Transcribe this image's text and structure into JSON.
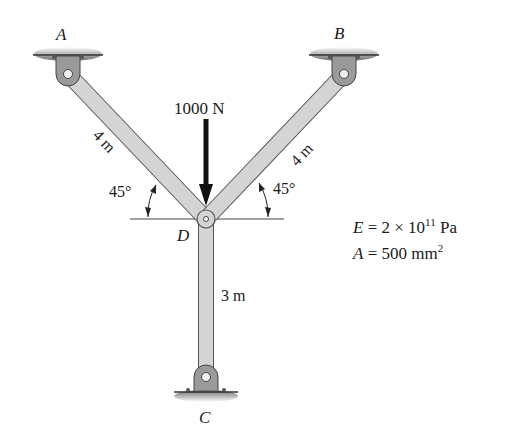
{
  "diagram": {
    "type": "truss-structure",
    "nodes": {
      "A": {
        "label": "A",
        "support": "pin",
        "x": 68,
        "y": 74
      },
      "B": {
        "label": "B",
        "support": "pin",
        "x": 344,
        "y": 74
      },
      "C": {
        "label": "C",
        "support": "pin",
        "x": 206,
        "y": 377
      },
      "D": {
        "label": "D",
        "joint": "pin",
        "x": 206,
        "y": 219
      }
    },
    "members": [
      {
        "id": "AD",
        "from": "A",
        "to": "D",
        "length_label": "4 m",
        "angle_label": "45°"
      },
      {
        "id": "BD",
        "from": "B",
        "to": "D",
        "length_label": "4 m",
        "angle_label": "45°"
      },
      {
        "id": "CD",
        "from": "C",
        "to": "D",
        "length_label": "3 m"
      }
    ],
    "load": {
      "label": "1000 N",
      "direction": "down",
      "at": "D"
    },
    "properties": {
      "E_label": "E",
      "E_eq": " = 2 × 10",
      "E_exp": "11",
      "E_unit": " Pa",
      "A_label": "A",
      "A_eq": " = 500 mm",
      "A_exp": "2"
    },
    "colors": {
      "member_fill": "#d4d4d4",
      "member_edge": "#555555",
      "bracket_fill": "#9a9a9a",
      "text": "#1a1a1a"
    }
  }
}
